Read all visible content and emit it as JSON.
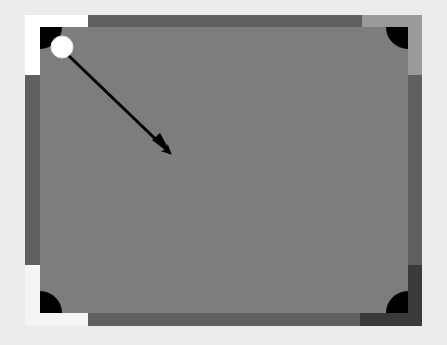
{
  "game": {
    "type": "billiards-table",
    "colors": {
      "background": "#ececec",
      "felt": "#7d7d7d",
      "cushion": "#606060",
      "corner_top_left": "#ffffff",
      "corner_top_right": "#9a9a9a",
      "corner_bottom_left": "#f4f4f4",
      "corner_bottom_right": "#3a3a3a",
      "pocket": "#000000",
      "ball": "#ffffff",
      "arrow": "#000000"
    },
    "cue_ball": {
      "cx": 62,
      "cy": 47,
      "r": 11
    },
    "aim_arrow": {
      "x1": 68,
      "y1": 55,
      "x2": 172,
      "y2": 155
    },
    "pockets": [
      "top-left",
      "top-right",
      "bottom-left",
      "bottom-right"
    ]
  }
}
